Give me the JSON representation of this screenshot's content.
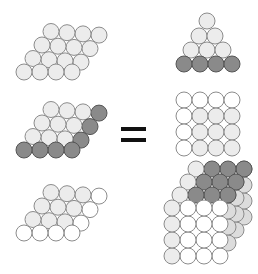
{
  "diagram": {
    "colors": {
      "light": "#ececec",
      "white": "#ffffff",
      "dark": "#8a8a8a",
      "mid": "#dcdcdc",
      "outline": "#8c8c8c",
      "dark_outline": "#555555",
      "equals": "#111111"
    },
    "equals_sign": "=",
    "radius": 8,
    "left_layers": [
      {
        "name": "layer-top",
        "origin": [
          24,
          72
        ],
        "pattern": [
          [
            "light",
            "light",
            "light",
            "light"
          ],
          [
            "light",
            "light",
            "light",
            "light"
          ],
          [
            "light",
            "light",
            "light",
            "light"
          ],
          [
            "light",
            "light",
            "light",
            "light"
          ]
        ]
      },
      {
        "name": "layer-middle",
        "origin": [
          24,
          150
        ],
        "pattern": [
          [
            "dark",
            "dark",
            "dark",
            "dark"
          ],
          [
            "light",
            "light",
            "light",
            "dark"
          ],
          [
            "light",
            "light",
            "light",
            "dark"
          ],
          [
            "light",
            "light",
            "light",
            "dark"
          ]
        ]
      },
      {
        "name": "layer-bottom",
        "origin": [
          24,
          233
        ],
        "pattern": [
          [
            "white",
            "white",
            "white",
            "white"
          ],
          [
            "light",
            "light",
            "light",
            "white"
          ],
          [
            "light",
            "light",
            "light",
            "white"
          ],
          [
            "light",
            "light",
            "light",
            "white"
          ]
        ]
      }
    ],
    "pyramid": {
      "rows": [
        {
          "y": 21,
          "xs": [
            207
          ],
          "type": "light"
        },
        {
          "y": 36,
          "xs": [
            199,
            215
          ],
          "type": "light"
        },
        {
          "y": 50,
          "xs": [
            191,
            207,
            223
          ],
          "type": "light"
        },
        {
          "y": 64,
          "xs": [
            184,
            200,
            216,
            232
          ],
          "type": "dark"
        }
      ]
    },
    "square_face": {
      "xs": [
        184,
        200,
        216,
        232
      ],
      "ys": [
        100,
        116,
        132,
        148
      ],
      "pattern": [
        [
          "white",
          "white",
          "white",
          "white"
        ],
        [
          "white",
          "light",
          "light",
          "light"
        ],
        [
          "white",
          "light",
          "light",
          "light"
        ],
        [
          "white",
          "light",
          "light",
          "light"
        ]
      ]
    },
    "cube": {
      "front_xs": [
        172,
        188,
        204,
        220
      ],
      "front_ys": [
        208,
        224,
        240,
        256
      ],
      "front_pattern": [
        [
          "light",
          "white",
          "white",
          "white"
        ],
        [
          "light",
          "white",
          "white",
          "white"
        ],
        [
          "light",
          "white",
          "white",
          "white"
        ],
        [
          "light",
          "white",
          "white",
          "white"
        ]
      ],
      "depth_offset": [
        8,
        -13
      ],
      "top_pattern": [
        [
          "dark",
          "dark",
          "dark",
          "dark"
        ],
        [
          "dark",
          "dark",
          "dark",
          "dark"
        ],
        [
          "dark",
          "dark",
          "dark",
          "dark"
        ]
      ],
      "top_left_edge": "light"
    }
  }
}
